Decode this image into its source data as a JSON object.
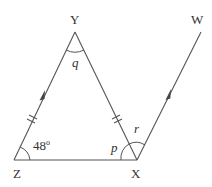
{
  "diagram": {
    "points": {
      "Y": "Y",
      "Z": "Z",
      "X": "X",
      "W": "W"
    },
    "angles": {
      "Z": "48",
      "Z_degree_symbol": "o",
      "Y": "q",
      "X_interior": "p",
      "X_exterior": "r"
    },
    "markings": {
      "equal_sides": [
        "ZY",
        "YX"
      ],
      "parallel_lines": [
        "ZY",
        "XW"
      ]
    },
    "colors": {
      "line": "#555555",
      "text": "#333333",
      "background": "#ffffff"
    }
  }
}
